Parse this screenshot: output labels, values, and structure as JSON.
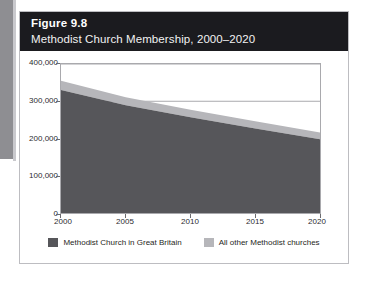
{
  "figure": {
    "number": "Figure 9.8",
    "title": "Methodist Church Membership, 2000–2020"
  },
  "colors": {
    "header_bg": "#1b1b1f",
    "series_primary": "#56565a",
    "series_secondary": "#b6b6ba",
    "plot_border": "#a9a9ad",
    "gridline": "#a9a9ad",
    "page_edge": "#8e8e92"
  },
  "legend": {
    "position": "bottom",
    "items": [
      {
        "label": "Methodist Church in Great Britain",
        "color": "#56565a",
        "icon": "legend-swatch-icon"
      },
      {
        "label": "All other Methodist churches",
        "color": "#b6b6ba",
        "icon": "legend-swatch-icon"
      }
    ]
  },
  "chart_data": {
    "type": "area",
    "stacked": true,
    "title": "Methodist Church Membership, 2000–2020",
    "subtitle": "Figure 9.8",
    "xlabel": "",
    "ylabel": "",
    "x": [
      2000,
      2005,
      2010,
      2015,
      2020
    ],
    "xlim": [
      2000,
      2020
    ],
    "xticks": [
      2000,
      2005,
      2010,
      2015,
      2020
    ],
    "xtick_labels": [
      "2000",
      "2005",
      "2010",
      "2015",
      "2020"
    ],
    "ylim": [
      0,
      400000
    ],
    "yticks": [
      0,
      100000,
      200000,
      300000,
      400000
    ],
    "ytick_labels": [
      "0",
      "100,000",
      "200,000",
      "300,000",
      "400,000"
    ],
    "grid": true,
    "gridlines_y": [
      300000,
      400000
    ],
    "series": [
      {
        "name": "Methodist Church in Great Britain",
        "color": "#56565a",
        "values": [
          330000,
          289000,
          257000,
          227000,
          198000
        ]
      },
      {
        "name": "All other Methodist churches",
        "color": "#b6b6ba",
        "values": [
          25000,
          22000,
          20000,
          19000,
          18000
        ]
      }
    ],
    "totals": [
      355000,
      311000,
      277000,
      246000,
      216000
    ]
  },
  "axes": {
    "y_ticks": [
      {
        "label": "400,000",
        "value": 400000
      },
      {
        "label": "300,000",
        "value": 300000
      },
      {
        "label": "200,000",
        "value": 200000
      },
      {
        "label": "100,000",
        "value": 100000
      },
      {
        "label": "0",
        "value": 0
      }
    ],
    "x_ticks": [
      {
        "label": "2000",
        "value": 2000
      },
      {
        "label": "2005",
        "value": 2005
      },
      {
        "label": "2010",
        "value": 2010
      },
      {
        "label": "2015",
        "value": 2015
      },
      {
        "label": "2020",
        "value": 2020
      }
    ]
  }
}
